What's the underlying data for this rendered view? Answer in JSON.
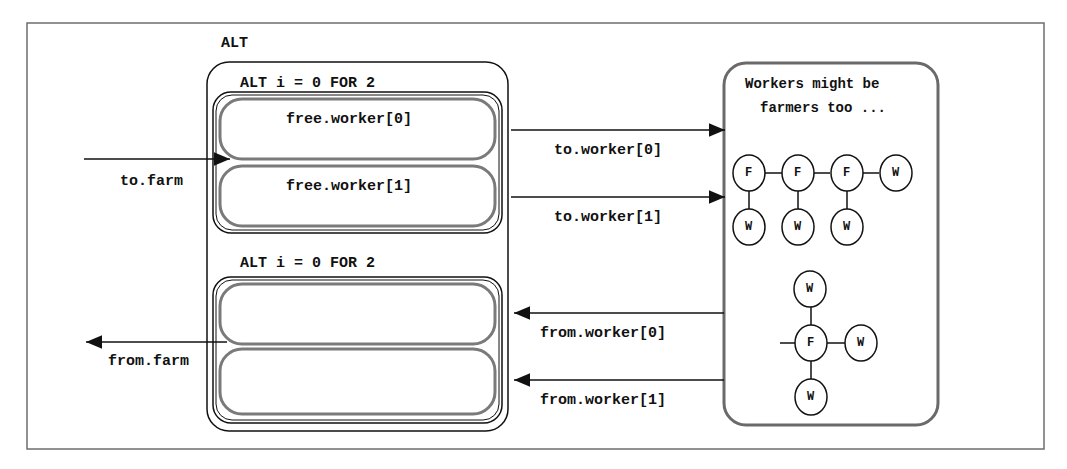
{
  "diagram": {
    "outer_label": "ALT",
    "top_group": {
      "label": "ALT i = 0 FOR 2",
      "guards": [
        "free.worker[0]",
        "free.worker[1]"
      ]
    },
    "bottom_group": {
      "label": "ALT i = 0 FOR 2",
      "guards": [
        "",
        ""
      ]
    },
    "channels": {
      "to_farm": "to.farm",
      "from_farm": "from.farm",
      "to_worker_0": "to.worker[0]",
      "to_worker_1": "to.worker[1]",
      "from_worker_0": "from.worker[0]",
      "from_worker_1": "from.worker[1]"
    },
    "note": {
      "line1": "Workers might be",
      "line2": "farmers too ..."
    },
    "tree_chain": {
      "top_row": [
        "F",
        "F",
        "F",
        "W"
      ],
      "bottom_row": [
        "W",
        "W",
        "W"
      ]
    },
    "tree_star": {
      "center": "F",
      "top": "W",
      "right": "W",
      "bottom": "W"
    },
    "colors": {
      "stroke": "#111111",
      "guard_stroke": "#7a7a7a",
      "frame": "#6e6e6e",
      "panel_stroke": "#6a6a6a"
    }
  }
}
